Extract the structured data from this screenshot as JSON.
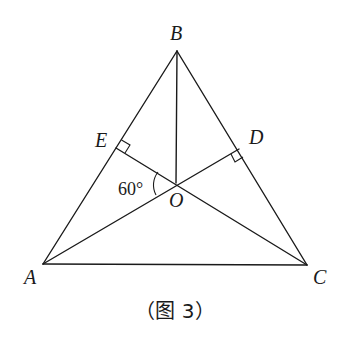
{
  "figure": {
    "caption": "（图 3）",
    "points": {
      "A": {
        "label": "A",
        "x": 43,
        "y": 264
      },
      "B": {
        "label": "B",
        "x": 177,
        "y": 51
      },
      "C": {
        "label": "C",
        "x": 307,
        "y": 265
      },
      "D": {
        "label": "D",
        "x": 239,
        "y": 149
      },
      "E": {
        "label": "E",
        "x": 116,
        "y": 148
      },
      "O": {
        "label": "O",
        "x": 176,
        "y": 183
      }
    },
    "angle_label": "60°",
    "segments": [
      "AB",
      "BC",
      "CA",
      "BO",
      "AD",
      "CE"
    ],
    "right_angles": [
      "E",
      "D"
    ],
    "colors": {
      "stroke": "#1a1a1a",
      "background": "#ffffff"
    }
  }
}
